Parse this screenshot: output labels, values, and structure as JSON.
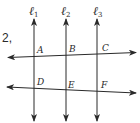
{
  "problem": {
    "number": "2,"
  },
  "lines": {
    "vertical": [
      {
        "name": "ℓ",
        "sub": "1",
        "x": 34
      },
      {
        "name": "ℓ",
        "sub": "2",
        "x": 66
      },
      {
        "name": "ℓ",
        "sub": "3",
        "x": 97
      }
    ],
    "transversals": [
      {
        "id": "top",
        "x1": 8,
        "y1": 57.5,
        "x2": 136,
        "y2": 52.5
      },
      {
        "id": "bottom",
        "x1": 7,
        "y1": 87,
        "x2": 136,
        "y2": 93
      }
    ]
  },
  "points": [
    {
      "label": "A",
      "x": 37,
      "y": 53
    },
    {
      "label": "B",
      "x": 69,
      "y": 52
    },
    {
      "label": "C",
      "x": 102,
      "y": 51
    },
    {
      "label": "D",
      "x": 37,
      "y": 85
    },
    {
      "label": "E",
      "x": 68,
      "y": 88
    },
    {
      "label": "F",
      "x": 101,
      "y": 88
    }
  ],
  "colors": {
    "ink": "#2a2a2a",
    "background": "#ffffff"
  }
}
